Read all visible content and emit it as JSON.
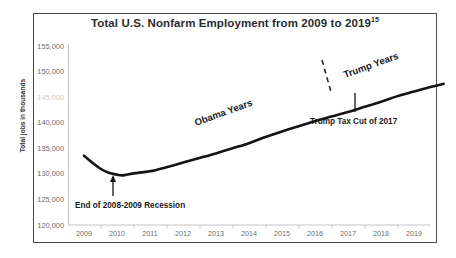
{
  "chart_data": {
    "type": "line",
    "title": "Total U.S. Nonfarm Employment from 2009 to 2019",
    "title_footnote": "15",
    "xlabel": "",
    "ylabel": "Total jobs in thousands",
    "xlim": [
      2009,
      2019.9
    ],
    "ylim": [
      120000,
      155000
    ],
    "ytick_step": 5000,
    "grid": false,
    "legend": "none",
    "x_ticks": [
      "2009",
      "2010",
      "2011",
      "2012",
      "2013",
      "2014",
      "2015",
      "2016",
      "2017",
      "2018",
      "2019"
    ],
    "y_ticks": [
      "120,000",
      "125,000",
      "130,000",
      "135,000",
      "140,000",
      "145,000",
      "150,000",
      "155,000"
    ],
    "y_tick_values": [
      120000,
      125000,
      130000,
      135000,
      140000,
      145000,
      150000,
      155000
    ],
    "y_tick_obscured": "145,000",
    "series": [
      {
        "name": "Total U.S. Nonfarm Employment",
        "color": "#141414",
        "x": [
          2009.0,
          2009.25,
          2009.5,
          2009.75,
          2010.0,
          2010.17,
          2010.5,
          2011.0,
          2011.5,
          2012.0,
          2012.5,
          2013.0,
          2013.5,
          2014.0,
          2014.5,
          2015.0,
          2015.5,
          2016.0,
          2016.5,
          2017.0,
          2017.5,
          2018.0,
          2018.5,
          2019.0,
          2019.5,
          2019.9
        ],
        "values": [
          133550,
          132200,
          131000,
          130200,
          129850,
          129700,
          130100,
          130500,
          131300,
          132200,
          133100,
          134000,
          135000,
          136000,
          137200,
          138300,
          139300,
          140300,
          141200,
          142100,
          143100,
          144100,
          145200,
          146100,
          147000,
          147600
        ]
      }
    ],
    "annotations": [
      {
        "name": "recession-annotation",
        "text": "End of 2008-2009 Recession",
        "x": 2010.05,
        "y": 129700,
        "kind": "arrow-up"
      },
      {
        "name": "tax-cut-annotation",
        "text": "Trump Tax Cut of 2017",
        "x": 2017.05,
        "y": 142200,
        "kind": "leader-line"
      },
      {
        "name": "obama-era-label",
        "text": "Obama Years",
        "kind": "rotated"
      },
      {
        "name": "trump-era-label",
        "text": "Trump Years",
        "kind": "rotated"
      },
      {
        "name": "era-divider",
        "text": "",
        "kind": "dashed-divider",
        "x": 2017.0
      }
    ]
  }
}
